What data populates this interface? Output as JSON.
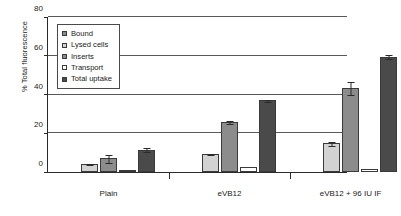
{
  "chart_data": {
    "type": "bar",
    "title": "",
    "subtitle": "",
    "xlabel": "",
    "ylabel": "% Total fluorescence",
    "categories": [
      "Plain",
      "eVB12",
      "eVB12 + 96 IU IF"
    ],
    "series": [
      {
        "name": "Bound",
        "color": "#8c8c8c",
        "values": [
          0,
          0,
          0
        ],
        "errors": [
          0,
          0,
          0
        ]
      },
      {
        "name": "Lysed cells",
        "color": "#d2d2d2",
        "values": [
          4.0,
          9.3,
          14.8
        ],
        "errors": [
          0.4,
          0.4,
          1.4
        ]
      },
      {
        "name": "Inserts",
        "color": "#8c8c8c",
        "values": [
          7.0,
          26.0,
          43.5
        ],
        "errors": [
          2.4,
          1.0,
          3.5
        ]
      },
      {
        "name": "Transport",
        "color": "#ffffff",
        "values": [
          1.1,
          2.4,
          1.3
        ],
        "errors": [
          0,
          0,
          0
        ]
      },
      {
        "name": "Total uptake",
        "color": "#4a4a4a",
        "values": [
          11.5,
          37.0,
          59.5
        ],
        "errors": [
          1.2,
          0.7,
          1.3
        ]
      }
    ],
    "ylim": [
      0,
      80
    ],
    "yticks": [
      0,
      20,
      40,
      60,
      80
    ],
    "grid": true,
    "grid_axis": "y",
    "legend_position": "upper-left",
    "legend_entries": [
      "Bound",
      "Lysed cells",
      "Inserts",
      "Transport",
      "Total uptake"
    ]
  },
  "axis": {
    "y_title": "% Total fluorescence"
  }
}
